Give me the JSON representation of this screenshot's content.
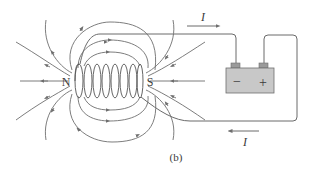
{
  "figure": {
    "caption": "(b)",
    "poles": {
      "north": "N",
      "south": "S"
    },
    "current_label_top": "I",
    "current_label_bottom": "I",
    "battery": {
      "negative": "−",
      "positive": "+",
      "fill": "#c8c8c8",
      "terminal_fill": "#9a9a9a"
    },
    "line_color": "#6e6e6e",
    "coil_turns": 8
  }
}
